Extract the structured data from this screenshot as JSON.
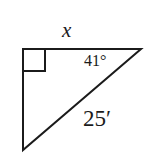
{
  "figure": {
    "kind": "geometry-diagram",
    "shape": "right-triangle",
    "background_color": "#ffffff",
    "stroke_color": "#1b1b1b",
    "stroke_width": 2
  },
  "labels": {
    "top_side": "x",
    "angle": "41°",
    "hypotenuse": "25′"
  },
  "markers": {
    "right_angle_square": "right-angle-marker"
  },
  "geometry": {
    "vertices": {
      "top_left": [
        23,
        49
      ],
      "top_right": [
        141,
        49
      ],
      "bottom_left": [
        23,
        150
      ]
    },
    "right_angle_square": {
      "x": 23,
      "y": 49,
      "size": 22
    }
  }
}
